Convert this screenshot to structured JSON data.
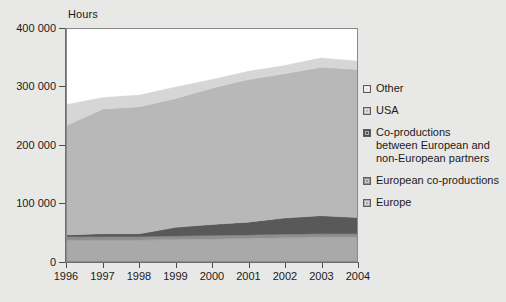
{
  "chart_data": {
    "type": "area",
    "title": "",
    "subtitle": "",
    "ylabel": "Hours",
    "xlabel": "",
    "ylim": [
      0,
      400000
    ],
    "xlim": [
      1996,
      2004
    ],
    "stacked": true,
    "grid": false,
    "legend_position": "right",
    "y_ticks": [
      0,
      100000,
      200000,
      300000,
      400000
    ],
    "y_tick_labels": [
      "0",
      "100 000",
      "200 000",
      "300 000",
      "400 000"
    ],
    "categories": [
      "1996",
      "1997",
      "1998",
      "1999",
      "2000",
      "2001",
      "2002",
      "2003",
      "2004"
    ],
    "x": [
      1996,
      1997,
      1998,
      1999,
      2000,
      2001,
      2002,
      2003,
      2004
    ],
    "series": [
      {
        "name": "Europe",
        "color": "#a9a9a9",
        "values": [
          36000,
          36000,
          36000,
          37000,
          38000,
          39000,
          40000,
          41000,
          41000
        ]
      },
      {
        "name": "European co-productions",
        "color": "#8f8f8f",
        "values": [
          6000,
          6000,
          6000,
          6000,
          6000,
          6000,
          6000,
          6000,
          6000
        ]
      },
      {
        "name": "Co-productions between European and non-European partners",
        "color": "#595959",
        "values": [
          3000,
          5000,
          5000,
          15000,
          19000,
          22000,
          28000,
          31000,
          28000
        ]
      },
      {
        "name": "USA",
        "color": "#b8b8b8",
        "values": [
          189000,
          215000,
          219000,
          222000,
          235000,
          246000,
          249000,
          256000,
          255000
        ]
      },
      {
        "name": "Other",
        "color": "#d6d6d6",
        "values": [
          36000,
          20000,
          20000,
          20000,
          15000,
          14000,
          14000,
          16000,
          15000
        ]
      }
    ],
    "stack_totals": [
      270000,
      282000,
      286000,
      300000,
      313000,
      327000,
      337000,
      350000,
      345000
    ]
  },
  "legend": {
    "items": [
      {
        "label": "Other",
        "color": "#d6d6d6"
      },
      {
        "label": "USA",
        "color": "#b8b8b8"
      },
      {
        "label": "Co-productions\nbetween European and\nnon-European partners",
        "color": "#595959"
      },
      {
        "label": "European co-productions",
        "color": "#8f8f8f"
      },
      {
        "label": "Europe",
        "color": "#a9a9a9"
      }
    ]
  },
  "axes": {
    "y_title": "Hours",
    "y_labels": [
      "400 000",
      "300 000",
      "200 000",
      "100 000",
      "0"
    ],
    "x_labels": [
      "1996",
      "1997",
      "1998",
      "1999",
      "2000",
      "2001",
      "2002",
      "2003",
      "2004"
    ]
  }
}
